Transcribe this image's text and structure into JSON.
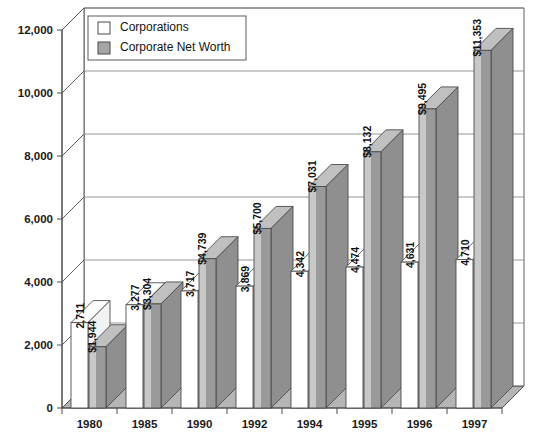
{
  "chart_data": {
    "type": "bar",
    "title": "",
    "subtitle": "",
    "xlabel": "",
    "ylabel": "",
    "categories": [
      "1980",
      "1985",
      "1990",
      "1992",
      "1994",
      "1995",
      "1996",
      "1997"
    ],
    "series": [
      {
        "name": "Corporations",
        "color": "#ffffff",
        "prefix": "",
        "values": [
          2711,
          3277,
          3717,
          3869,
          4342,
          4474,
          4631,
          4710
        ],
        "labels": [
          "2,711",
          "3,277",
          "3,717",
          "3,869",
          "4,342",
          "4,474",
          "4,631",
          "4,710"
        ]
      },
      {
        "name": "Corporate Net Worth",
        "color": "#9a9a9a",
        "prefix": "$",
        "values": [
          1944,
          3304,
          4739,
          5700,
          7031,
          8132,
          9495,
          11353
        ],
        "labels": [
          "$1,944",
          "$3,304",
          "$4,739",
          "$5,700",
          "$7,031",
          "$8,132",
          "$9,495",
          "$11,353"
        ]
      }
    ],
    "ylim": [
      0,
      12000
    ],
    "yticks": [
      0,
      2000,
      4000,
      6000,
      8000,
      10000,
      12000
    ],
    "ytick_labels": [
      "0",
      "2,000",
      "4,000",
      "6,000",
      "8,000",
      "10,000",
      "12,000"
    ],
    "grid": true,
    "legend_position": "top-left-inside",
    "projection": "3d"
  },
  "legend": {
    "entries": [
      {
        "label": "Corporations",
        "swatch": "#ffffff"
      },
      {
        "label": "Corporate Net Worth",
        "swatch": "#a6a6a6"
      }
    ]
  },
  "colors": {
    "bar_white_front": "#ffffff",
    "bar_white_top": "#ffffff",
    "bar_gray_left": "#c8c8c8",
    "bar_gray_front": "#9a9a9a",
    "bar_gray_top": "#c0c0c0",
    "floor": "#b5b5b5",
    "wall": "#ffffff",
    "gridline": "#8a8a8a",
    "outline": "#4d4d4d",
    "text": "#111111"
  }
}
